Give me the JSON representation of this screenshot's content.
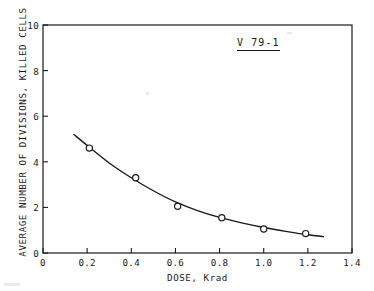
{
  "chart_data": {
    "type": "scatter",
    "title": "",
    "annotation": "V 79-1",
    "xlabel": "DOSE, Krad",
    "ylabel": "AVERAGE NUMBER OF DIVISIONS, KILLED CELLS",
    "xlim": [
      0,
      1.4
    ],
    "ylim": [
      0,
      10
    ],
    "xticks": [
      "0",
      "0.2",
      "0.4",
      "0.6",
      "0.8",
      "1.0",
      "1.2",
      "1.4"
    ],
    "xtick_values": [
      0,
      0.2,
      0.4,
      0.6,
      0.8,
      1.0,
      1.2,
      1.4
    ],
    "yticks": [
      "0",
      "2",
      "4",
      "6",
      "8",
      "10"
    ],
    "ytick_values": [
      0,
      2,
      4,
      6,
      8,
      10
    ],
    "grid": false,
    "legend": null,
    "marker": "open-circle",
    "line_color": "#1a1a1a",
    "marker_color": "#1a1a1a",
    "x": [
      0.21,
      0.42,
      0.61,
      0.81,
      1.0,
      1.19
    ],
    "values": [
      4.6,
      3.3,
      2.05,
      1.55,
      1.05,
      0.85
    ],
    "series": [
      {
        "name": "V 79-1 killed cells",
        "x": [
          0.21,
          0.42,
          0.61,
          0.81,
          1.0,
          1.19
        ],
        "values": [
          4.6,
          3.3,
          2.05,
          1.55,
          1.05,
          0.85
        ]
      }
    ],
    "fit_curve": {
      "name": "fitted decay curve",
      "x": [
        0.14,
        0.2,
        0.3,
        0.4,
        0.5,
        0.6,
        0.7,
        0.8,
        0.9,
        1.0,
        1.1,
        1.2,
        1.27
      ],
      "values": [
        5.2,
        4.72,
        3.95,
        3.3,
        2.73,
        2.24,
        1.86,
        1.56,
        1.32,
        1.12,
        0.95,
        0.8,
        0.72
      ]
    }
  }
}
